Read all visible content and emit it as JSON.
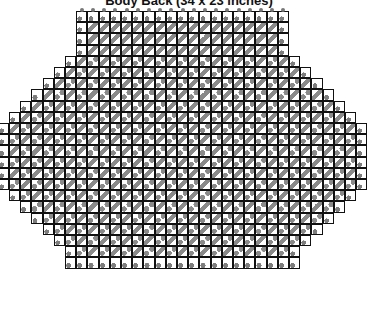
{
  "title": "Body Back (34 x 23 inches)",
  "colors": {
    "grid_line": "#111111",
    "motif_fill": "#8a8a8a",
    "background": "#ffffff"
  },
  "grid": {
    "origin_x": 9,
    "origin_y": 11,
    "cell_size": 11.2,
    "columns": 32,
    "rows": [
      {
        "start": 6,
        "end": 24,
        "type": "top"
      },
      {
        "start": 6,
        "end": 24,
        "type": "top"
      },
      {
        "start": 6,
        "end": 24,
        "type": "top"
      },
      {
        "start": 6,
        "end": 24,
        "type": "top"
      },
      {
        "start": 5,
        "end": 25,
        "type": "body"
      },
      {
        "start": 4,
        "end": 26,
        "type": "body"
      },
      {
        "start": 3,
        "end": 27,
        "type": "body"
      },
      {
        "start": 2,
        "end": 28,
        "type": "body"
      },
      {
        "start": 1,
        "end": 29,
        "type": "body"
      },
      {
        "start": 0,
        "end": 30,
        "type": "body"
      },
      {
        "start": -1,
        "end": 31,
        "type": "body"
      },
      {
        "start": -1,
        "end": 31,
        "type": "body"
      },
      {
        "start": -1,
        "end": 31,
        "type": "body"
      },
      {
        "start": -1,
        "end": 31,
        "type": "body"
      },
      {
        "start": -1,
        "end": 31,
        "type": "body"
      },
      {
        "start": -1,
        "end": 31,
        "type": "body"
      },
      {
        "start": 0,
        "end": 30,
        "type": "body"
      },
      {
        "start": 1,
        "end": 29,
        "type": "body"
      },
      {
        "start": 2,
        "end": 28,
        "type": "body"
      },
      {
        "start": 3,
        "end": 27,
        "type": "body"
      },
      {
        "start": 4,
        "end": 26,
        "type": "body"
      },
      {
        "start": 5,
        "end": 25,
        "type": "body"
      },
      {
        "start": 5,
        "end": 25,
        "type": "bottom"
      }
    ]
  }
}
